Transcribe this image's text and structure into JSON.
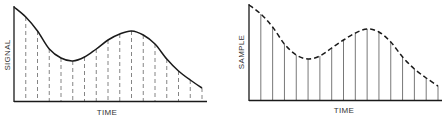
{
  "chart_data": [
    {
      "type": "line",
      "title": "",
      "xlabel": "TIME",
      "ylabel": "SIGNAL",
      "description": "Continuous analog signal curve with dashed vertical sampling lines",
      "curve_style": "solid",
      "sample_line_style": "dashed",
      "x": [
        0,
        1,
        2,
        3,
        4,
        5,
        6,
        7,
        8,
        9,
        10,
        11,
        12,
        13,
        14,
        15,
        16
      ],
      "values": [
        94,
        84,
        70,
        52,
        43,
        40,
        44,
        52,
        61,
        67,
        70,
        66,
        57,
        42,
        30,
        21,
        13
      ],
      "ylim": [
        0,
        100
      ]
    },
    {
      "type": "line",
      "title": "",
      "xlabel": "TIME",
      "ylabel": "SAMPLE",
      "description": "Sampled values shown as solid vertical lines with dashed envelope curve",
      "curve_style": "dashed",
      "sample_line_style": "solid",
      "x": [
        0,
        1,
        2,
        3,
        4,
        5,
        6,
        7,
        8,
        9,
        10,
        11,
        12,
        13,
        14,
        15,
        16
      ],
      "values": [
        95,
        86,
        73,
        56,
        45,
        41,
        44,
        52,
        60,
        67,
        71,
        68,
        58,
        43,
        31,
        22,
        14
      ],
      "ylim": [
        0,
        100
      ]
    }
  ],
  "left": {
    "xlabel": "TIME",
    "ylabel": "SIGNAL"
  },
  "right": {
    "xlabel": "TIME",
    "ylabel": "SAMPLE"
  },
  "colors": {
    "line": "#1a1a1a",
    "sample": "#555555"
  }
}
